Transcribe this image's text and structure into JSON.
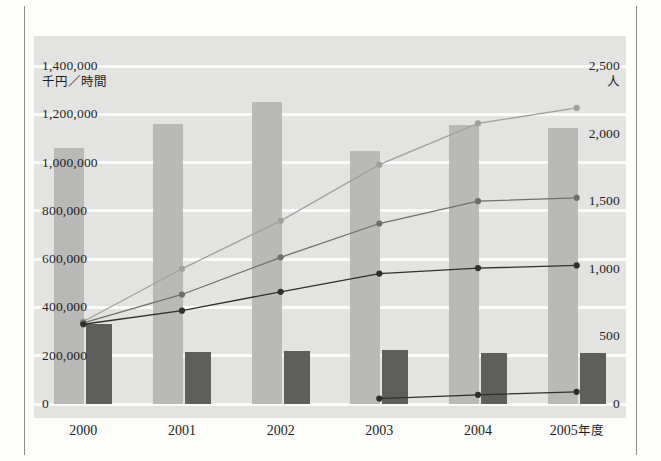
{
  "chart_data": {
    "type": "bar",
    "title": "",
    "subtitle": "",
    "xlabel": "",
    "categories": [
      "2000",
      "2001",
      "2002",
      "2003",
      "2004",
      "2005"
    ],
    "category_suffix": "年度",
    "grid": true,
    "legend": "none",
    "axes": {
      "left": {
        "label": "千円／時間",
        "ylim": [
          0,
          1400000
        ],
        "tick_step": 200000,
        "ticks": [
          "0",
          "200,000",
          "400,000",
          "600,000",
          "800,000",
          "1,000,000",
          "1,200,000",
          "1,400,000"
        ],
        "tick_values": [
          0,
          200000,
          400000,
          600000,
          800000,
          1000000,
          1200000,
          1400000
        ]
      },
      "right": {
        "label": "人",
        "ylim": [
          0,
          2500
        ],
        "tick_step": 500,
        "ticks": [
          "0",
          "500",
          "1,000",
          "1,500",
          "2,000",
          "2,500"
        ],
        "tick_values": [
          0,
          500,
          1000,
          1500,
          2000,
          2500
        ]
      }
    },
    "series": [
      {
        "name": "bar-light",
        "kind": "bar",
        "axis": "left",
        "color": "#b9b9b7",
        "values": [
          1060000,
          1160000,
          1250000,
          1050000,
          1155000,
          1145000
        ]
      },
      {
        "name": "bar-dark",
        "kind": "bar",
        "axis": "left",
        "color": "#5e5e5c",
        "values": [
          330000,
          215000,
          220000,
          225000,
          210000,
          212000
        ]
      },
      {
        "name": "line-light",
        "kind": "line",
        "axis": "right",
        "color": "#a0a09e",
        "values": [
          610,
          1000,
          1355,
          1770,
          2075,
          2190
        ]
      },
      {
        "name": "line-medium",
        "kind": "line",
        "axis": "right",
        "color": "#6f6f6d",
        "values": [
          600,
          810,
          1085,
          1335,
          1500,
          1525
        ]
      },
      {
        "name": "line-dark",
        "kind": "line",
        "axis": "right",
        "color": "#2f2f2d",
        "values": [
          590,
          690,
          830,
          965,
          1005,
          1025
        ]
      },
      {
        "name": "line-baseline",
        "kind": "line",
        "axis": "right",
        "color": "#2f2f2d",
        "values": [
          null,
          null,
          null,
          40,
          68,
          90
        ]
      }
    ]
  }
}
